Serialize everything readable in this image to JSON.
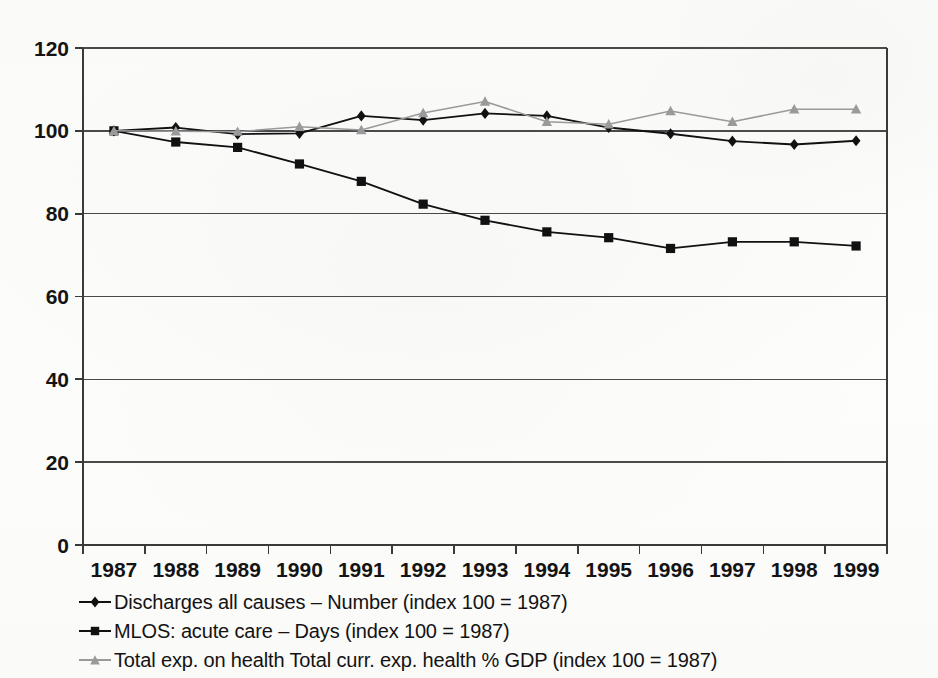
{
  "chart_data": {
    "type": "line",
    "title": "",
    "subtitle": "",
    "xlabel": "",
    "ylabel": "",
    "categories": [
      "1987",
      "1988",
      "1989",
      "1990",
      "1991",
      "1992",
      "1993",
      "1994",
      "1995",
      "1996",
      "1997",
      "1998",
      "1999"
    ],
    "ylim": [
      0,
      120
    ],
    "yticks": [
      0,
      20,
      40,
      60,
      80,
      100,
      120
    ],
    "grid": "horizontal",
    "legend_position": "below",
    "series": [
      {
        "name": "Discharges all causes – Number (index 100 = 1987)",
        "marker": "diamond",
        "color": "#111111",
        "values": [
          100.0,
          100.8,
          99.2,
          99.4,
          103.6,
          102.6,
          104.2,
          103.6,
          100.8,
          99.3,
          97.5,
          96.7,
          97.6
        ]
      },
      {
        "name": "MLOS: acute care – Days (index 100 = 1987)",
        "marker": "square",
        "color": "#111111",
        "values": [
          100.0,
          97.3,
          96.0,
          92.0,
          87.8,
          82.3,
          78.4,
          75.6,
          74.2,
          71.6,
          73.2,
          73.2,
          72.2
        ]
      },
      {
        "name": "Total exp. on health Total curr. exp. health % GDP (index 100 = 1987)",
        "marker": "triangle",
        "color": "#9a9a9a",
        "values": [
          100.0,
          99.9,
          99.8,
          101.0,
          100.2,
          104.3,
          107.1,
          102.2,
          101.6,
          104.8,
          102.2,
          105.2,
          105.2
        ]
      }
    ]
  },
  "axes": {
    "y_tick_labels": [
      "120",
      "100",
      "80",
      "60",
      "40",
      "20",
      "0"
    ],
    "x_tick_labels": [
      "1987",
      "1988",
      "1989",
      "1990",
      "1991",
      "1992",
      "1993",
      "1994",
      "1995",
      "1996",
      "1997",
      "1998",
      "1999"
    ]
  },
  "legend": {
    "items": [
      {
        "label": "Discharges all causes – Number (index 100 = 1987)",
        "marker": "diamond-marker",
        "color": "#111111"
      },
      {
        "label": "MLOS: acute care – Days (index 100 = 1987)",
        "marker": "square-marker",
        "color": "#111111"
      },
      {
        "label": "Total exp. on health Total curr. exp. health % GDP (index 100 = 1987)",
        "marker": "triangle-marker",
        "color": "#9a9a9a"
      }
    ]
  },
  "colors": {
    "axis": "#3a3a3a",
    "grid": "#4a4a4a",
    "series_dark": "#111111",
    "series_gray": "#9a9a9a",
    "text": "#131313",
    "background": "#fdfdfc"
  }
}
